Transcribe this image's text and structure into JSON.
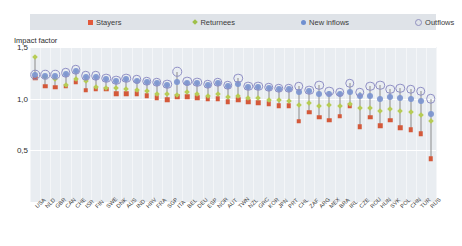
{
  "axis_title": "Impact factor",
  "legend": [
    {
      "label": "Stayers",
      "marker": "square-marker",
      "color": "#d4593a"
    },
    {
      "label": "Returnees",
      "marker": "diamond-marker",
      "color": "#b6cc55"
    },
    {
      "label": "New inflows",
      "marker": "filled-circle-marker",
      "color": "#7b94cf"
    },
    {
      "label": "Outflows",
      "marker": "open-circle-marker",
      "color": "#8e8ec4"
    }
  ],
  "chart_data": {
    "type": "scatter",
    "title": "",
    "xlabel": "",
    "ylabel": "Impact factor",
    "ylim": [
      0,
      1.5
    ],
    "yticks": [
      "0,5",
      "1,0",
      "1,5"
    ],
    "ytick_values": [
      0.5,
      1.0,
      1.5
    ],
    "grid": true,
    "legend_position": "top",
    "categories": [
      "USA",
      "NLD",
      "GBR",
      "CAN",
      "CHE",
      "ISR",
      "FIN",
      "SWE",
      "DNK",
      "AUS",
      "IND",
      "HRV",
      "FRA",
      "SGP",
      "ITA",
      "BEL",
      "DEU",
      "ESP",
      "NOR",
      "AUT",
      "TWN",
      "NZL",
      "GRC",
      "KOR",
      "JPN",
      "PRT",
      "CHL",
      "ZAF",
      "ARG",
      "MEX",
      "BRA",
      "IRL",
      "CZE",
      "ROU",
      "HUN",
      "SVK",
      "POL",
      "CHN",
      "TUR",
      "RUS"
    ],
    "series": [
      {
        "name": "Stayers",
        "marker": "square",
        "color": "#d4593a",
        "values": [
          1.2,
          1.12,
          1.11,
          1.12,
          1.16,
          1.08,
          1.09,
          1.09,
          1.05,
          1.05,
          1.05,
          1.03,
          1.01,
          0.99,
          1.02,
          1.02,
          1.01,
          1.0,
          1.0,
          0.97,
          0.99,
          0.97,
          0.96,
          0.95,
          0.93,
          0.93,
          0.78,
          0.87,
          0.82,
          0.79,
          0.83,
          0.93,
          0.73,
          0.82,
          0.74,
          0.79,
          0.72,
          0.7,
          0.66,
          0.42
        ]
      },
      {
        "name": "Returnees",
        "marker": "diamond",
        "color": "#b6cc55",
        "values": [
          1.4,
          1.21,
          1.19,
          1.13,
          1.19,
          1.17,
          1.11,
          1.1,
          1.1,
          1.09,
          1.08,
          1.07,
          1.05,
          1.05,
          1.04,
          1.06,
          1.05,
          1.03,
          1.05,
          1.02,
          1.03,
          1.01,
          1.01,
          0.99,
          0.99,
          0.98,
          0.94,
          0.96,
          0.93,
          0.94,
          0.93,
          0.95,
          0.91,
          0.91,
          0.88,
          0.9,
          0.88,
          0.87,
          0.84,
          0.78
        ]
      },
      {
        "name": "New inflows",
        "marker": "circle",
        "color": "#7b94cf",
        "values": [
          1.23,
          1.22,
          1.22,
          1.24,
          1.27,
          1.21,
          1.21,
          1.19,
          1.17,
          1.19,
          1.17,
          1.16,
          1.15,
          1.13,
          1.16,
          1.15,
          1.15,
          1.13,
          1.15,
          1.12,
          1.14,
          1.11,
          1.11,
          1.1,
          1.09,
          1.09,
          1.06,
          1.07,
          1.05,
          1.05,
          1.05,
          1.06,
          1.03,
          1.03,
          1.0,
          1.02,
          1.01,
          1.0,
          0.98,
          0.85
        ]
      },
      {
        "name": "Outflows",
        "marker": "open-circle",
        "color": "#8e8ec4",
        "values": [
          1.23,
          1.23,
          1.23,
          1.25,
          1.28,
          1.22,
          1.22,
          1.2,
          1.18,
          1.2,
          1.19,
          1.17,
          1.16,
          1.14,
          1.26,
          1.17,
          1.16,
          1.14,
          1.16,
          1.13,
          1.2,
          1.12,
          1.12,
          1.11,
          1.1,
          1.1,
          1.12,
          1.08,
          1.13,
          1.07,
          1.06,
          1.15,
          1.06,
          1.12,
          1.13,
          1.09,
          1.1,
          1.09,
          1.07,
          1.0
        ]
      }
    ]
  }
}
